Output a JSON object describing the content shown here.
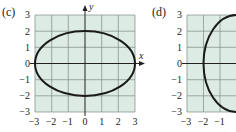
{
  "panels": [
    {
      "id": "c",
      "label": "(c)",
      "x_axis_label": "x",
      "y_axis_label": "y",
      "x_ticks": [
        "−3",
        "−2",
        "−1",
        "0",
        "1",
        "2",
        "3"
      ],
      "y_ticks": [
        "3",
        "2",
        "1",
        "0",
        "−1",
        "−2",
        "−3"
      ],
      "curve": "ellipse",
      "semi_axis_x": 3,
      "semi_axis_y": 2
    },
    {
      "id": "d",
      "label": "(d)",
      "x_ticks": [
        "−3",
        "−2",
        "−1"
      ],
      "y_ticks": [
        "3",
        "2",
        "1",
        "0",
        "−1",
        "−2",
        "−3"
      ],
      "curve": "ellipse",
      "semi_axis_x": 2,
      "semi_axis_y": 3
    }
  ],
  "colors": {
    "grid_fill": "#dcebe3",
    "grid_line": "#6f7f78",
    "curve": "#1a1a1a",
    "axis": "#222222"
  }
}
